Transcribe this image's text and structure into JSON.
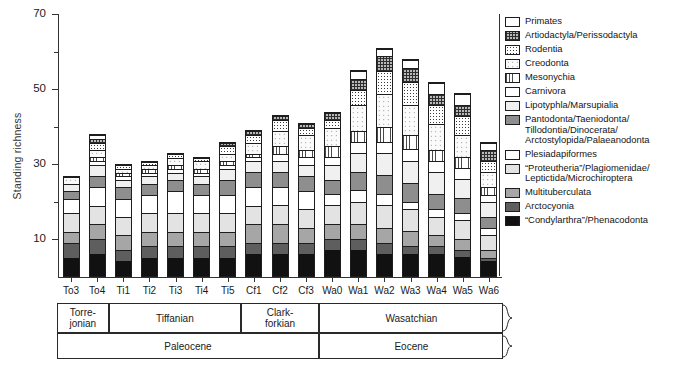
{
  "axes": {
    "y_title": "Standing richness",
    "y_major_ticks": [
      10,
      30,
      50,
      70
    ],
    "y_minor_ticks": [
      20,
      40,
      60
    ],
    "y_tick_labels": [
      "10",
      "30",
      "50",
      "70"
    ]
  },
  "legend": {
    "items": [
      {
        "label": "Primates",
        "fill": "f-white"
      },
      {
        "label": "Artiodactyla/Perissodactyla",
        "fill": "f-grid"
      },
      {
        "label": "Rodentia",
        "fill": "f-stipple"
      },
      {
        "label": "Creodonta",
        "fill": "f-speckle"
      },
      {
        "label": "Mesonychia",
        "fill": "f-vlines"
      },
      {
        "label": "Carnivora",
        "fill": "f-white"
      },
      {
        "label": "Lipotyphla/Marsupialia",
        "fill": "f-llgray"
      },
      {
        "label": "Pantodonta/Taeniodonta/\nTillodontia/Dinocerata/\nArctostylopida/Palaeanodonta",
        "fill": "f-mgray"
      },
      {
        "label": "Plesiadapiformes",
        "fill": "f-white"
      },
      {
        "label": "“Proteutheria”/Plagiomenidae/\nLeptictida/Microchiroptera",
        "fill": "f-lgray"
      },
      {
        "label": "Multituberculata",
        "fill": "f-mgray2"
      },
      {
        "label": "Arctocyonia",
        "fill": "f-dgray"
      },
      {
        "label": "“Condylarthra”/Phenacodonta",
        "fill": "f-black"
      }
    ]
  },
  "strat": {
    "ages": [
      {
        "label": "Torre-\njonian",
        "start": 0,
        "span": 2
      },
      {
        "label": "Tiffanian",
        "start": 2,
        "span": 5
      },
      {
        "label": "Clark-\nforkian",
        "start": 7,
        "span": 3
      },
      {
        "label": "Wasatchian",
        "start": 10,
        "span": 7
      }
    ],
    "epochs": [
      {
        "label": "Paleocene",
        "start": 0,
        "span": 10
      },
      {
        "label": "Eocene",
        "start": 10,
        "span": 7
      }
    ]
  },
  "chart_data": {
    "type": "bar",
    "title": "",
    "xlabel": "",
    "ylabel": "Standing richness",
    "ylim": [
      0,
      70
    ],
    "grid": false,
    "legend_position": "right",
    "stacked": true,
    "categories": [
      "To3",
      "To4",
      "Ti1",
      "Ti2",
      "Ti3",
      "Ti4",
      "Ti5",
      "Cf1",
      "Cf2",
      "Cf3",
      "Wa0",
      "Wa1",
      "Wa2",
      "Wa3",
      "Wa4",
      "Wa5",
      "Wa6"
    ],
    "totals": [
      27,
      38,
      30,
      31,
      33,
      32,
      36,
      39,
      43,
      41,
      44,
      55,
      61,
      58,
      52,
      49,
      36
    ],
    "series": [
      {
        "name": "“Condylarthra”/Phenacodonta",
        "fill": "f-black",
        "values": [
          5,
          6,
          4,
          5,
          5,
          5,
          5,
          6,
          6,
          6,
          7,
          7,
          6,
          6,
          6,
          5,
          4
        ]
      },
      {
        "name": "Arctocyonia",
        "fill": "f-dgray",
        "values": [
          4,
          4,
          3,
          3,
          3,
          3,
          3,
          3,
          3,
          3,
          3,
          3,
          3,
          2,
          2,
          2,
          1
        ]
      },
      {
        "name": "Multituberculata",
        "fill": "f-mgray2",
        "values": [
          3,
          4,
          4,
          4,
          4,
          4,
          4,
          5,
          5,
          4,
          4,
          4,
          4,
          4,
          3,
          3,
          2
        ]
      },
      {
        "name": "“Proteutheria”/Plagiomenidae/Leptictida/Microchiroptera",
        "fill": "f-lgray",
        "values": [
          5,
          5,
          5,
          5,
          5,
          5,
          5,
          5,
          5,
          5,
          5,
          6,
          6,
          6,
          5,
          5,
          4
        ]
      },
      {
        "name": "Plesiadapiformes",
        "fill": "f-white",
        "values": [
          4,
          5,
          5,
          5,
          6,
          5,
          5,
          5,
          5,
          5,
          3,
          3,
          3,
          2,
          2,
          2,
          2
        ]
      },
      {
        "name": "Pantodonta/Taeniodonta/Tillodontia/Dinocerata/Arctostylopida/Palaeanodonta",
        "fill": "f-mgray",
        "values": [
          2,
          3,
          3,
          3,
          3,
          3,
          4,
          4,
          4,
          4,
          4,
          5,
          5,
          5,
          4,
          4,
          3
        ]
      },
      {
        "name": "Lipotyphla/Marsupialia",
        "fill": "f-llgray",
        "values": [
          2,
          3,
          2,
          2,
          2,
          2,
          3,
          3,
          3,
          3,
          4,
          5,
          6,
          6,
          6,
          5,
          4
        ]
      },
      {
        "name": "Carnivora",
        "fill": "f-white",
        "values": [
          0,
          1,
          1,
          1,
          1,
          1,
          1,
          1,
          2,
          2,
          2,
          3,
          3,
          3,
          3,
          3,
          2
        ]
      },
      {
        "name": "Mesonychia",
        "fill": "f-vlines",
        "values": [
          0,
          1,
          1,
          1,
          1,
          1,
          1,
          1,
          2,
          2,
          3,
          3,
          4,
          4,
          3,
          3,
          2
        ]
      },
      {
        "name": "Creodonta",
        "fill": "f-speckle",
        "values": [
          2,
          2,
          1,
          1,
          2,
          2,
          2,
          3,
          4,
          4,
          5,
          7,
          9,
          8,
          7,
          6,
          4
        ]
      },
      {
        "name": "Rodentia",
        "fill": "f-stipple",
        "values": [
          0,
          2,
          1,
          1,
          1,
          1,
          2,
          2,
          3,
          2,
          2,
          4,
          6,
          6,
          5,
          5,
          3
        ]
      },
      {
        "name": "Artiodactyla/Perissodactyla",
        "fill": "f-grid",
        "values": [
          0,
          1,
          0,
          0,
          0,
          0,
          1,
          1,
          1,
          1,
          2,
          3,
          4,
          4,
          3,
          3,
          3
        ]
      },
      {
        "name": "Primates",
        "fill": "f-white",
        "values": [
          0,
          1,
          0,
          0,
          0,
          0,
          0,
          0,
          0,
          0,
          0,
          2,
          2,
          2,
          3,
          3,
          2
        ]
      }
    ]
  }
}
